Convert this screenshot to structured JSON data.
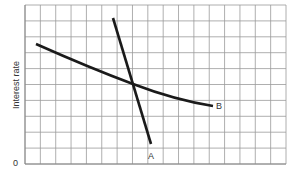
{
  "chart_data": {
    "type": "line",
    "title": "",
    "xlabel": "",
    "ylabel": "Interest rate",
    "origin_label": "0",
    "grid": true,
    "grid_cells": {
      "cols": 17,
      "rows": 10
    },
    "series": [
      {
        "name": "A",
        "description": "steep downward-sloping line",
        "points": [
          [
            5.7,
            9.4
          ],
          [
            8.2,
            1.3
          ]
        ]
      },
      {
        "name": "B",
        "description": "gently downward-sloping convex curve",
        "points": [
          [
            0.7,
            7.7
          ],
          [
            3.5,
            6.5
          ],
          [
            7.0,
            5.1
          ],
          [
            10.0,
            4.2
          ],
          [
            12.4,
            3.7
          ]
        ]
      }
    ],
    "intersection": [
      7.0,
      5.1
    ]
  },
  "labels": {
    "ylabel": "Interest rate",
    "origin": "0",
    "a": "A",
    "b": "B"
  }
}
